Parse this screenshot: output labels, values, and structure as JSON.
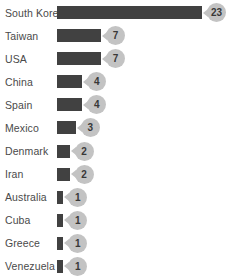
{
  "chart_data": {
    "type": "bar",
    "orientation": "horizontal",
    "title": "",
    "xlabel": "",
    "ylabel": "",
    "legend": false,
    "grid": false,
    "xlim": [
      0,
      23
    ],
    "categories": [
      "South Korea",
      "Taiwan",
      "USA",
      "China",
      "Spain",
      "Mexico",
      "Denmark",
      "Iran",
      "Australia",
      "Cuba",
      "Greece",
      "Venezuela"
    ],
    "values": [
      23,
      7,
      7,
      4,
      4,
      3,
      2,
      2,
      1,
      1,
      1,
      1
    ],
    "data_labels": [
      "23",
      "7",
      "7",
      "4",
      "4",
      "3",
      "2",
      "2",
      "1",
      "1",
      "1",
      "1"
    ],
    "colors": {
      "bar": "#414141",
      "badge_fill": "#c3c3c3",
      "badge_text": "#383838",
      "category_label": "#4a4a4a",
      "background": "#ffffff"
    }
  }
}
